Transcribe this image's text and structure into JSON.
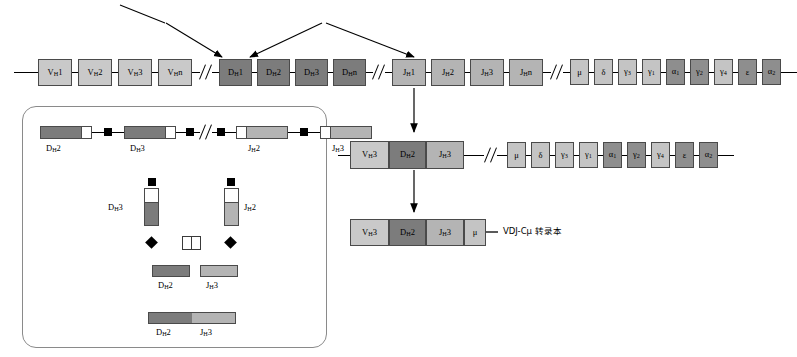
{
  "figure": {
    "colors": {
      "v_segment": "#c9c9c9",
      "d_segment": "#7c7c7c",
      "j_segment": "#b4b4b4",
      "constant_light": "#c4c4c4",
      "constant_dark": "#8e8e8e",
      "line": "#000000",
      "inset_border": "#8a8a8a",
      "background": "#ffffff"
    }
  },
  "germline_locus": {
    "v_segments": [
      {
        "label": "V",
        "sub": "H",
        "num": "1"
      },
      {
        "label": "V",
        "sub": "H",
        "num": "2"
      },
      {
        "label": "V",
        "sub": "H",
        "num": "3"
      },
      {
        "label": "V",
        "sub": "H",
        "num": "n"
      }
    ],
    "d_segments": [
      {
        "label": "D",
        "sub": "H",
        "num": "1"
      },
      {
        "label": "D",
        "sub": "H",
        "num": "2"
      },
      {
        "label": "D",
        "sub": "H",
        "num": "3"
      },
      {
        "label": "D",
        "sub": "H",
        "num": "n"
      }
    ],
    "j_segments": [
      {
        "label": "J",
        "sub": "H",
        "num": "1"
      },
      {
        "label": "J",
        "sub": "H",
        "num": "2"
      },
      {
        "label": "J",
        "sub": "H",
        "num": "3"
      },
      {
        "label": "J",
        "sub": "H",
        "num": "n"
      }
    ],
    "constant_genes": [
      {
        "label": "μ",
        "shade": "light"
      },
      {
        "label": "δ",
        "shade": "light"
      },
      {
        "label": "γ3",
        "shade": "light"
      },
      {
        "label": "γ1",
        "shade": "light"
      },
      {
        "label": "α1",
        "shade": "dark"
      },
      {
        "label": "γ2",
        "shade": "dark"
      },
      {
        "label": "γ4",
        "shade": "light"
      },
      {
        "label": "ε",
        "shade": "dark"
      },
      {
        "label": "α2",
        "shade": "dark"
      }
    ]
  },
  "rearranged_locus": {
    "segments": [
      {
        "label": "V",
        "sub": "H",
        "num": "3",
        "type": "v"
      },
      {
        "label": "D",
        "sub": "H",
        "num": "2",
        "type": "d"
      },
      {
        "label": "J",
        "sub": "H",
        "num": "3",
        "type": "j"
      }
    ],
    "constant_genes": [
      {
        "label": "μ",
        "shade": "light"
      },
      {
        "label": "δ",
        "shade": "light"
      },
      {
        "label": "γ3",
        "shade": "light"
      },
      {
        "label": "γ1",
        "shade": "light"
      },
      {
        "label": "α1",
        "shade": "dark"
      },
      {
        "label": "γ2",
        "shade": "dark"
      },
      {
        "label": "γ4",
        "shade": "light"
      },
      {
        "label": "ε",
        "shade": "dark"
      },
      {
        "label": "α2",
        "shade": "dark"
      }
    ]
  },
  "transcript": {
    "segments": [
      {
        "label": "V",
        "sub": "H",
        "num": "3",
        "type": "v"
      },
      {
        "label": "D",
        "sub": "H",
        "num": "2",
        "type": "d"
      },
      {
        "label": "J",
        "sub": "H",
        "num": "3",
        "type": "j"
      },
      {
        "label": "μ",
        "sub": "",
        "num": "",
        "type": "c"
      }
    ],
    "annotation": "VDJ-Cμ 转录本"
  },
  "inset": {
    "top_row": [
      {
        "label": "D",
        "sub": "H",
        "num": "2"
      },
      {
        "label": "D",
        "sub": "H",
        "num": "3"
      },
      {
        "label": "J",
        "sub": "H",
        "num": "2"
      },
      {
        "label": "J",
        "sub": "H",
        "num": "3"
      }
    ],
    "loop": {
      "left_label": {
        "label": "D",
        "sub": "H",
        "num": "3"
      },
      "right_label": {
        "label": "J",
        "sub": "H",
        "num": "2"
      }
    },
    "products": [
      {
        "label": "D",
        "sub": "H",
        "num": "2"
      },
      {
        "label": "J",
        "sub": "H",
        "num": "3"
      }
    ],
    "joined": [
      {
        "label": "D",
        "sub": "H",
        "num": "2"
      },
      {
        "label": "J",
        "sub": "H",
        "num": "3"
      }
    ]
  }
}
